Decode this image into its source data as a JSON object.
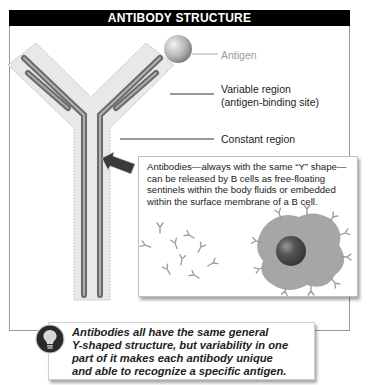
{
  "header": {
    "title": "ANTIBODY STRUCTURE"
  },
  "labels": {
    "antigen": "Antigen",
    "variable_region_line1": "Variable region",
    "variable_region_line2": "(antigen-binding site)",
    "constant_region": "Constant region"
  },
  "infobox": {
    "lines": [
      "Antibodies—always with the same “Y” shape—",
      "can be released by B cells as free-floating",
      "sentinels within the body fluids or embedded",
      "within the surface membrane of a B cell."
    ],
    "illustration": {
      "free_antibodies": "free-floating-antibodies",
      "b_cell": "b-cell-with-membrane-antibodies"
    }
  },
  "callout": {
    "icon": "lightbulb-icon",
    "lines": [
      "Antibodies all have the same general",
      "Y-shaped structure, but variability in one",
      "part of it makes each antibody unique",
      "and able to recognize a specific antigen."
    ]
  },
  "colors": {
    "header_bg": "#000000",
    "header_text": "#ffffff",
    "halo": "#e6e6e6",
    "chain_dark": "#6e6e6e",
    "chain_light": "#a8a8a8",
    "cell_body": "#a6a6a6",
    "nucleus": "#4a4a4a"
  }
}
